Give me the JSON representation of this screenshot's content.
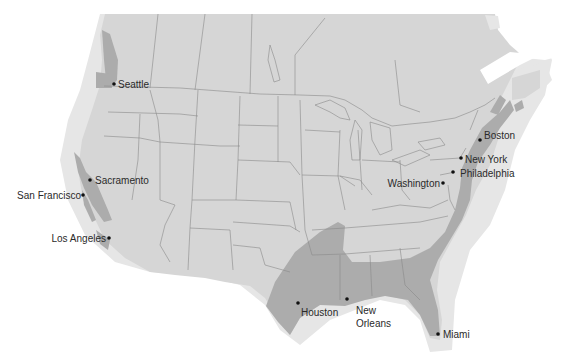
{
  "map": {
    "title": "",
    "colors": {
      "background": "#ffffff",
      "shelf": "#e4e4e4",
      "land": "#d6d6d6",
      "highlight": "#acacac",
      "border": "#8a8a8a",
      "dot": "#111111",
      "text": "#2a2a2a"
    },
    "cities": [
      {
        "name": "Seattle",
        "x": 114,
        "y": 84,
        "lx": 118,
        "ly": 88,
        "anchor": "start"
      },
      {
        "name": "Sacramento",
        "x": 90,
        "y": 180,
        "lx": 95,
        "ly": 184,
        "anchor": "start"
      },
      {
        "name": "San Francisco",
        "x": 83,
        "y": 195,
        "lx": 81,
        "ly": 199,
        "anchor": "end"
      },
      {
        "name": "Los Angeles",
        "x": 109,
        "y": 238,
        "lx": 106,
        "ly": 242,
        "anchor": "end"
      },
      {
        "name": "Boston",
        "x": 480,
        "y": 140,
        "lx": 484,
        "ly": 139,
        "anchor": "start"
      },
      {
        "name": "New York",
        "x": 461,
        "y": 158,
        "lx": 465,
        "ly": 163,
        "anchor": "start"
      },
      {
        "name": "Philadelphia",
        "x": 453,
        "y": 172,
        "lx": 460,
        "ly": 177,
        "anchor": "start"
      },
      {
        "name": "Washington",
        "x": 443,
        "y": 183,
        "lx": 440,
        "ly": 187,
        "anchor": "end"
      },
      {
        "name": "Houston",
        "x": 298,
        "y": 303,
        "lx": 301,
        "ly": 316,
        "anchor": "start"
      },
      {
        "name": "New Orleans",
        "x": 347,
        "y": 299,
        "lx": 356,
        "ly": 314,
        "lx2": 356,
        "ly2": 327,
        "anchor": "start",
        "line1": "New",
        "line2": "Orleans"
      },
      {
        "name": "Miami",
        "x": 438,
        "y": 334,
        "lx": 443,
        "ly": 338,
        "anchor": "start"
      }
    ]
  }
}
